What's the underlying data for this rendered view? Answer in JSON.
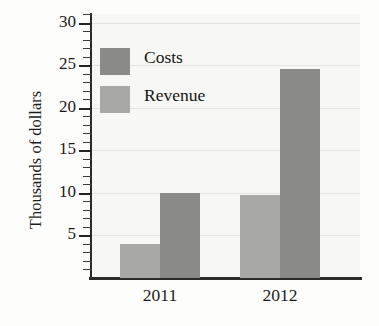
{
  "chart_data": {
    "type": "bar",
    "title": "",
    "xlabel": "",
    "ylabel": "Thousands of dollars",
    "categories": [
      "2011",
      "2012"
    ],
    "series": [
      {
        "name": "Revenue",
        "values": [
          4,
          9.8
        ],
        "color": "#a8a8a6"
      },
      {
        "name": "Costs",
        "values": [
          10,
          24.5
        ],
        "color": "#8a8a89"
      }
    ],
    "ylim": [
      0,
      31
    ],
    "y_major_ticks": [
      5,
      10,
      15,
      20,
      25,
      30
    ],
    "y_tick_labels": [
      "5",
      "10",
      "15",
      "20",
      "25",
      "30"
    ],
    "y_minor_tick_step": 1,
    "grid": true,
    "grid_axis": "y",
    "legend_position": "upper-left-inside",
    "bar_order_in_group": [
      "Revenue",
      "Costs"
    ]
  },
  "legend": {
    "items": [
      {
        "label": "Costs",
        "swatch": "costs"
      },
      {
        "label": "Revenue",
        "swatch": "revenue"
      }
    ]
  },
  "axes": {
    "y_title": "Thousands of dollars",
    "y_labels": [
      "30",
      "25",
      "20",
      "15",
      "10",
      "5"
    ],
    "x_labels": [
      "2011",
      "2012"
    ]
  },
  "colors": {
    "costs": "#8a8a89",
    "revenue": "#a8a8a6",
    "axis": "#2a2a2a",
    "gridline": "#e2e2de",
    "paper": "#f7f7f5",
    "text": "#1a1a1a"
  }
}
